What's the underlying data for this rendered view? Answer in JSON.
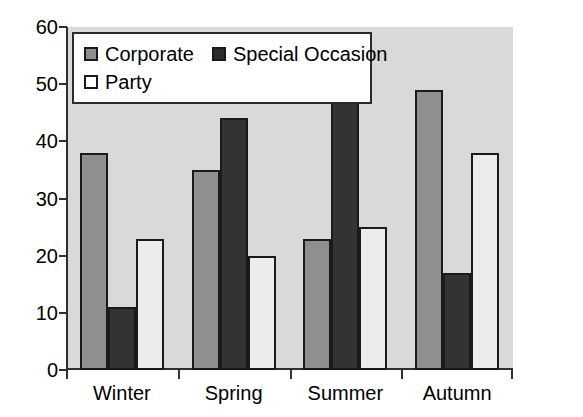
{
  "chart_data": {
    "type": "bar",
    "title": "",
    "xlabel": "",
    "ylabel": "",
    "categories": [
      "Winter",
      "Spring",
      "Summer",
      "Autumn"
    ],
    "series": [
      {
        "name": "Corporate",
        "color": "#8f8f8f",
        "values": [
          38,
          35,
          23,
          49
        ]
      },
      {
        "name": "Special Occasion",
        "color": "#2b2b2b",
        "values": [
          11,
          44,
          47,
          17
        ]
      },
      {
        "name": "Party",
        "color": "#ffffff",
        "values": [
          23,
          20,
          25,
          38
        ]
      }
    ],
    "ylim": [
      0,
      60
    ],
    "yticks": [
      0,
      10,
      20,
      30,
      40,
      50,
      60
    ],
    "ytick_labels": [
      "0",
      "10",
      "20",
      "30",
      "40",
      "50",
      "60"
    ],
    "grid": false,
    "legend_position": "top-left",
    "plot_background": "#d9d9d9",
    "axis_color": "#303030"
  },
  "legend": {
    "entries": [
      {
        "label": "Corporate"
      },
      {
        "label": "Special Occasion"
      },
      {
        "label": "Party"
      }
    ]
  }
}
